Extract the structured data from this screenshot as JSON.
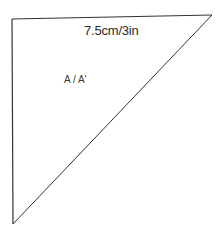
{
  "diagram": {
    "type": "pattern-piece",
    "shape": "right-triangle",
    "dimension_label": "7.5cm/3in",
    "piece_label": "A / A'",
    "stroke_color": "#333333",
    "background": "#ffffff"
  }
}
